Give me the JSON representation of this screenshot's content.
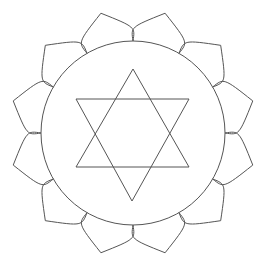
{
  "diagram": {
    "center": [
      133,
      133
    ],
    "stroke_color": "#555555",
    "background": "#ffffff",
    "petal_count": 12,
    "circle_radius": 92,
    "petal_tip_radius": 124,
    "elements": [
      "outer lotus of 12 petals",
      "inner circle",
      "upward triangle",
      "downward triangle"
    ],
    "triangle_up": [
      [
        133,
        69
      ],
      [
        76,
        167
      ],
      [
        189,
        167
      ]
    ],
    "triangle_down": [
      [
        132,
        201
      ],
      [
        76,
        99
      ],
      [
        189,
        99
      ]
    ]
  }
}
